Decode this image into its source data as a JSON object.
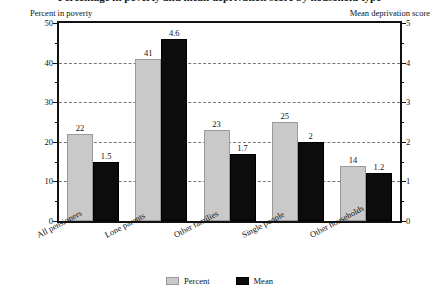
{
  "chart_data": {
    "type": "bar",
    "title": "Percentage in poverty and mean deprivation score by household type",
    "categories": [
      "All pensioners",
      "Lone parents",
      "Other families",
      "Single people",
      "Other households"
    ],
    "series": [
      {
        "name": "Percent",
        "color": "#c9c9c9",
        "axis": "left",
        "values": [
          22,
          41,
          23,
          25,
          14
        ],
        "labels": [
          "22",
          "41",
          "23",
          "25",
          "14"
        ]
      },
      {
        "name": "Mean",
        "color": "#0c0c0c",
        "axis": "right",
        "values": [
          1.5,
          4.6,
          1.7,
          2,
          1.2
        ],
        "labels": [
          "1.5",
          "4.6",
          "1.7",
          "2",
          "1.2"
        ]
      }
    ],
    "left_axis": {
      "label": "Percent in poverty",
      "ylim": [
        0,
        50
      ],
      "major_ticks": [
        0,
        10,
        20,
        30,
        40,
        50
      ],
      "major_tick_labels": [
        "0",
        "10",
        "20",
        "30",
        "40",
        "50"
      ],
      "minor_ticks": [
        5,
        15,
        25,
        35,
        45
      ],
      "gridlines": [
        10,
        20,
        30,
        40
      ]
    },
    "right_axis": {
      "label": "Mean deprivation score",
      "ylim": [
        0,
        5
      ],
      "major_ticks": [
        0,
        1,
        2,
        3,
        4,
        5
      ],
      "major_tick_labels": [
        "0",
        "1",
        "2",
        "3",
        "4",
        "5"
      ],
      "minor_ticks": [
        0.5,
        1.5,
        2.5,
        3.5,
        4.5
      ]
    },
    "xlabel": "",
    "grid": true,
    "legend_position": "bottom"
  }
}
